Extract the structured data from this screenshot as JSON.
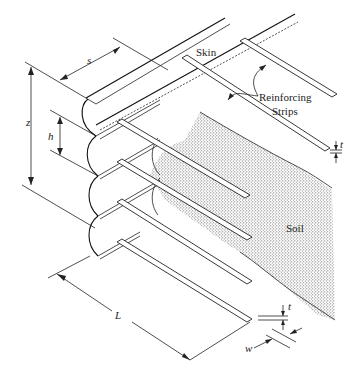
{
  "figure": {
    "type": "diagram",
    "labels": {
      "skin": "Skin",
      "reinforcing_strips_line1": "Reinforcing",
      "reinforcing_strips_line2": "Strips",
      "soil": "Soil"
    },
    "dimensions": {
      "s": "s",
      "z": "z",
      "h": "h",
      "L": "L",
      "t_top": "t",
      "t_bottom": "t",
      "w": "w"
    },
    "colors": {
      "line": "#222222",
      "soil_fill": "#9a9a9a",
      "background": "#ffffff"
    }
  }
}
